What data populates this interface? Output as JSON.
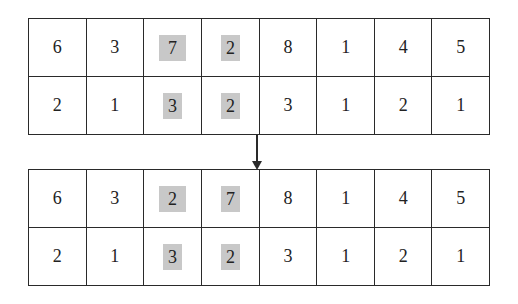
{
  "diagram": {
    "highlight_color": "#c8c8c8",
    "before": {
      "row1": [
        "6",
        "3",
        "7",
        "2",
        "8",
        "1",
        "4",
        "5"
      ],
      "row2": [
        "2",
        "1",
        "3",
        "2",
        "3",
        "1",
        "2",
        "1"
      ],
      "highlighted_columns": [
        2,
        3
      ]
    },
    "after": {
      "row1": [
        "6",
        "3",
        "2",
        "7",
        "8",
        "1",
        "4",
        "5"
      ],
      "row2": [
        "2",
        "1",
        "3",
        "2",
        "3",
        "1",
        "2",
        "1"
      ],
      "highlighted_columns": [
        2,
        3
      ]
    },
    "arrow": "down-arrow"
  }
}
